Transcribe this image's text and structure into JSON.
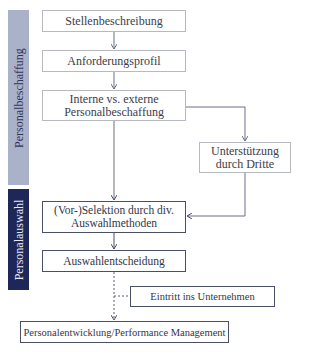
{
  "diagram": {
    "phases": [
      {
        "id": "beschaffung",
        "label": "Personalbeschaffung",
        "color": "#aab2ca"
      },
      {
        "id": "auswahl",
        "label": "Personalauswahl",
        "color": "#1e2758"
      }
    ],
    "nodes": {
      "stellen": {
        "label": "Stellenbeschreibung"
      },
      "anford": {
        "label": "Anforderungsprofil"
      },
      "intext": {
        "line1": "Interne vs. externe",
        "line2": "Personalbeschaffung"
      },
      "dritte": {
        "line1": "Unterstützung",
        "line2": "durch Dritte"
      },
      "selektion": {
        "line1": "(Vor-)Selektion durch div.",
        "line2": "Auswahlmethoden"
      },
      "entscheidung": {
        "label": "Auswahlentscheidung"
      },
      "eintritt": {
        "label": "Eintritt ins Unternehmen"
      },
      "entwicklung": {
        "label": "Personalentwicklung/Performance Management"
      }
    },
    "edges": [
      {
        "from": "stellen",
        "to": "anford",
        "style": "solid"
      },
      {
        "from": "anford",
        "to": "intext",
        "style": "solid"
      },
      {
        "from": "intext",
        "to": "selektion",
        "style": "solid"
      },
      {
        "from": "intext",
        "to": "dritte",
        "style": "solid"
      },
      {
        "from": "dritte",
        "to": "selektion",
        "style": "solid"
      },
      {
        "from": "selektion",
        "to": "entscheidung",
        "style": "solid"
      },
      {
        "from": "entscheidung",
        "to": "entwicklung",
        "style": "dashed"
      },
      {
        "from": "eintritt",
        "to": "entscheidung-entwicklung-link",
        "style": "dashed"
      }
    ]
  }
}
